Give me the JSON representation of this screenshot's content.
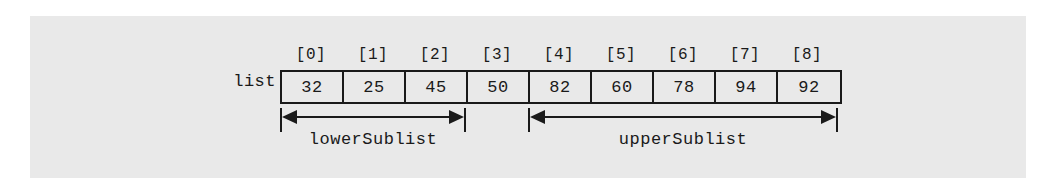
{
  "diagram": {
    "array_label": "list",
    "indices": [
      "[0]",
      "[1]",
      "[2]",
      "[3]",
      "[4]",
      "[5]",
      "[6]",
      "[7]",
      "[8]"
    ],
    "values": [
      "32",
      "25",
      "45",
      "50",
      "82",
      "60",
      "78",
      "94",
      "92"
    ],
    "annotations": [
      {
        "label": "lowerSublist",
        "start_index": 0,
        "end_index": 2
      },
      {
        "label": "upperSublist",
        "start_index": 4,
        "end_index": 8
      }
    ],
    "colors": {
      "panel_background": "#e9e9e9",
      "page_background": "#ffffff",
      "ink": "#1a1a1a"
    }
  }
}
